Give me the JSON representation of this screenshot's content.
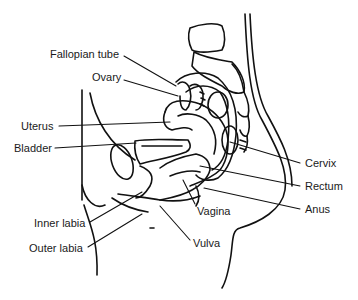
{
  "diagram": {
    "colors": {
      "line": "#111111",
      "text": "#1a1a1a",
      "background": "#ffffff"
    },
    "labels": [
      {
        "id": "fallopian-tube",
        "text": "Fallopian tube",
        "side": "left"
      },
      {
        "id": "ovary",
        "text": "Ovary",
        "side": "left"
      },
      {
        "id": "uterus",
        "text": "Uterus",
        "side": "left"
      },
      {
        "id": "bladder",
        "text": "Bladder",
        "side": "left"
      },
      {
        "id": "inner-labia",
        "text": "Inner labia",
        "side": "left"
      },
      {
        "id": "outer-labia",
        "text": "Outer labia",
        "side": "left"
      },
      {
        "id": "cervix",
        "text": "Cervix",
        "side": "right"
      },
      {
        "id": "rectum",
        "text": "Rectum",
        "side": "right"
      },
      {
        "id": "anus",
        "text": "Anus",
        "side": "right"
      },
      {
        "id": "vagina",
        "text": "Vagina",
        "side": "bottom"
      },
      {
        "id": "vulva",
        "text": "Vulva",
        "side": "bottom"
      }
    ]
  }
}
